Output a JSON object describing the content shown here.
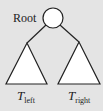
{
  "diagram": {
    "type": "binary-tree-schematic",
    "root": {
      "label": "Root"
    },
    "subtrees": [
      {
        "label_main": "T",
        "label_sub": "left"
      },
      {
        "label_main": "T",
        "label_sub": "right"
      }
    ],
    "colors": {
      "background": "#e4e4e4",
      "stroke": "#222222",
      "fill": "#ffffff"
    }
  }
}
